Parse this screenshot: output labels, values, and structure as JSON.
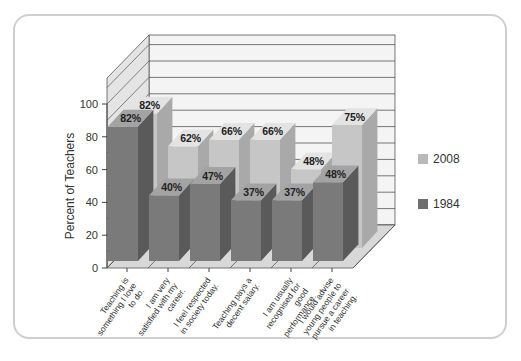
{
  "chart_data": {
    "type": "bar",
    "title": "",
    "xlabel": "",
    "ylabel": "Percent of Teachers",
    "ylim": [
      0,
      100
    ],
    "yticks": [
      0,
      20,
      40,
      60,
      80,
      100
    ],
    "grid": true,
    "three_d": true,
    "legend_position": "right",
    "categories": [
      "Teaching is something I love to do.",
      "I am very satisfied with my career.",
      "I feel respected in society today.",
      "Teaching pays a decent salary.",
      "I am usually recognised for good performance.",
      "I would advise young people to pursue a career in teaching."
    ],
    "series": [
      {
        "name": "2008",
        "color": "#b9b9b9",
        "values": [
          82,
          62,
          66,
          66,
          48,
          75
        ],
        "labels": [
          "82%",
          "62%",
          "66%",
          "66%",
          "48%",
          "75%"
        ]
      },
      {
        "name": "1984",
        "color": "#7a7a7a",
        "values": [
          82,
          40,
          47,
          37,
          37,
          48
        ],
        "labels": [
          "82%",
          "40%",
          "47%",
          "37%",
          "37%",
          "48%"
        ]
      }
    ]
  },
  "legend": {
    "items": [
      {
        "label": "2008",
        "color": "#b9b9b9"
      },
      {
        "label": "1984",
        "color": "#7a7a7a"
      }
    ]
  },
  "axis": {
    "ylabel": "Percent of Teachers",
    "ticks": [
      "0",
      "20",
      "40",
      "60",
      "80",
      "100"
    ]
  },
  "categories_lines": [
    [
      "Teaching is",
      "something I love",
      "to do."
    ],
    [
      "I am very",
      "satisfied with my",
      "career."
    ],
    [
      "I feel respected",
      "in society today."
    ],
    [
      "Teaching pays a",
      "decent salary."
    ],
    [
      "I am usually",
      "recognised for",
      "good",
      "performance."
    ],
    [
      "I would advise",
      "young people to",
      "pursue a career",
      "in teaching."
    ]
  ]
}
